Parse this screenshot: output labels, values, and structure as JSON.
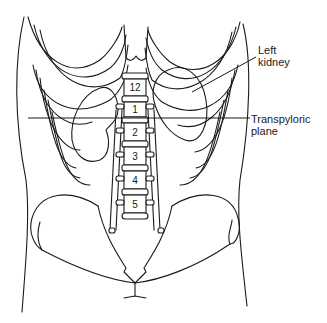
{
  "labels": {
    "left_kidney_line1": "Left",
    "left_kidney_line2": "kidney",
    "transpyloric_line1": "Transpyloric",
    "transpyloric_line2": "plane"
  },
  "vertebrae": [
    "12",
    "1",
    "2",
    "3",
    "4",
    "5"
  ],
  "colors": {
    "stroke": "#1a1a1a",
    "background": "#ffffff"
  }
}
